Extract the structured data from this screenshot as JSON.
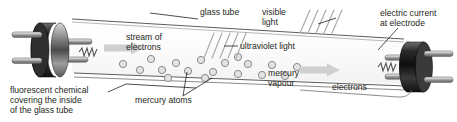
{
  "diagram": {
    "background_color": "#ffffff",
    "text_color": "#231f20",
    "labels": {
      "glass_tube": "glass tube",
      "visible_light_line1": "visible",
      "visible_light_line2": "light",
      "electric_current_line1": "electric current",
      "electric_current_line2": "at electrode",
      "stream_line1": "stream of",
      "stream_line2": "electrons",
      "ultraviolet_light": "ultraviolet light",
      "mercury_vapour_line1": "mercury",
      "mercury_vapour_line2": "vapour",
      "electrons": "electrons",
      "mercury_atoms": "mercury atoms",
      "fluorescent_line1": "fluorescent chemical",
      "fluorescent_line2": "covering the inside",
      "fluorescent_line3": "of the glass tube"
    },
    "colors": {
      "outline": "#231f20",
      "tube_glass": "#f7f7f7",
      "electrode_dark": "#1a1a1a",
      "electrode_metal": "#b9b9b9",
      "atom_fill": "#e3e3e3",
      "atom_stroke": "#8a8a8a",
      "arrow_fill": "#cfcfcf",
      "ray_stroke": "#b0b0b0",
      "leader": "#231f20"
    },
    "mercury_atoms": [
      {
        "cx": 123,
        "cy": 64,
        "r": 3.6
      },
      {
        "cx": 140,
        "cy": 70,
        "r": 3.6
      },
      {
        "cx": 151,
        "cy": 59,
        "r": 3.6
      },
      {
        "cx": 162,
        "cy": 70,
        "r": 3.6
      },
      {
        "cx": 176,
        "cy": 63,
        "r": 3.6
      },
      {
        "cx": 188,
        "cy": 71,
        "r": 3.6
      },
      {
        "cx": 201,
        "cy": 60,
        "r": 3.6
      },
      {
        "cx": 213,
        "cy": 72,
        "r": 3.6
      },
      {
        "cx": 225,
        "cy": 63,
        "r": 3.6
      },
      {
        "cx": 238,
        "cy": 74,
        "r": 3.6
      },
      {
        "cx": 248,
        "cy": 64,
        "r": 3.6
      },
      {
        "cx": 262,
        "cy": 75,
        "r": 3.6
      },
      {
        "cx": 272,
        "cy": 65,
        "r": 3.6
      },
      {
        "cx": 285,
        "cy": 76,
        "r": 3.6
      },
      {
        "cx": 297,
        "cy": 67,
        "r": 3.6
      },
      {
        "cx": 238,
        "cy": 57,
        "r": 3.6
      },
      {
        "cx": 205,
        "cy": 78,
        "r": 3.6
      },
      {
        "cx": 168,
        "cy": 78,
        "r": 3.6
      }
    ],
    "visible_light_rays": [
      {
        "x1": 300,
        "y1": 33,
        "x2": 310,
        "y2": 10
      },
      {
        "x1": 308,
        "y1": 33,
        "x2": 318,
        "y2": 10
      },
      {
        "x1": 316,
        "y1": 33,
        "x2": 326,
        "y2": 10
      },
      {
        "x1": 324,
        "y1": 33,
        "x2": 334,
        "y2": 10
      },
      {
        "x1": 332,
        "y1": 33,
        "x2": 342,
        "y2": 10
      }
    ],
    "ultraviolet_rays": [
      {
        "x1": 204,
        "y1": 58,
        "x2": 214,
        "y2": 33
      },
      {
        "x1": 212,
        "y1": 58,
        "x2": 222,
        "y2": 33
      },
      {
        "x1": 220,
        "y1": 58,
        "x2": 230,
        "y2": 33
      },
      {
        "x1": 228,
        "y1": 58,
        "x2": 238,
        "y2": 33
      },
      {
        "x1": 236,
        "y1": 58,
        "x2": 246,
        "y2": 33
      }
    ],
    "arrows": [
      {
        "name": "left-electron-flow",
        "x": 104,
        "y": 48,
        "width": 40,
        "direction": "right"
      },
      {
        "name": "right-electron-flow",
        "x": 300,
        "y": 70,
        "width": 40,
        "direction": "right"
      }
    ]
  }
}
